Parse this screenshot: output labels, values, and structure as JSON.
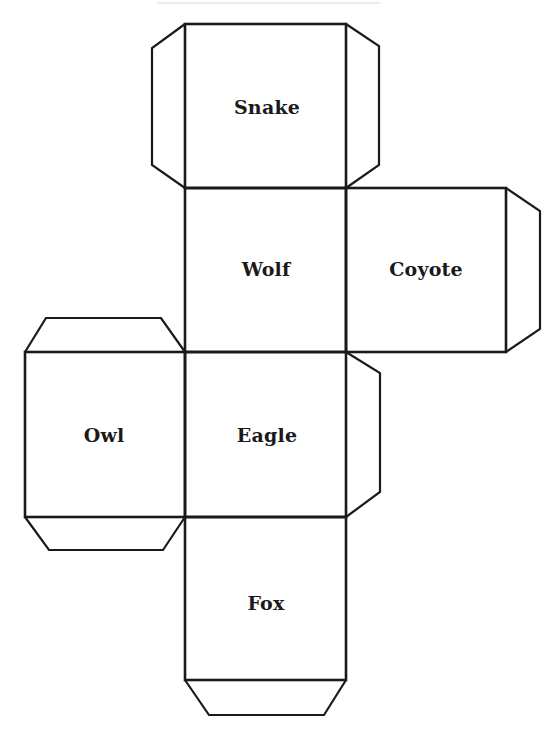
{
  "diagram": {
    "type": "cube-net",
    "stroke_color": "#1a1a1a",
    "background": "#ffffff",
    "faces": [
      {
        "id": "snake",
        "label": "Snake",
        "x": 185,
        "y": 24,
        "w": 161,
        "h": 164,
        "cx": 267,
        "cy": 107
      },
      {
        "id": "wolf",
        "label": "Wolf",
        "x": 185,
        "y": 188,
        "w": 161,
        "h": 164,
        "cx": 266,
        "cy": 269
      },
      {
        "id": "coyote",
        "label": "Coyote",
        "x": 346,
        "y": 188,
        "w": 160,
        "h": 164,
        "cx": 426,
        "cy": 269
      },
      {
        "id": "owl",
        "label": "Owl",
        "x": 25,
        "y": 352,
        "w": 160,
        "h": 165,
        "cx": 104,
        "cy": 435
      },
      {
        "id": "eagle",
        "label": "Eagle",
        "x": 185,
        "y": 352,
        "w": 161,
        "h": 165,
        "cx": 267,
        "cy": 435
      },
      {
        "id": "fox",
        "label": "Fox",
        "x": 185,
        "y": 517,
        "w": 161,
        "h": 163,
        "cx": 266,
        "cy": 603
      }
    ],
    "tabs": [
      {
        "id": "snake-left-tab",
        "points": "185,24 152,48 152,165 185,188"
      },
      {
        "id": "snake-right-tab",
        "points": "346,24 379,46 379,165 346,188"
      },
      {
        "id": "coyote-right-tab",
        "points": "506,188 540,211 540,329 506,352"
      },
      {
        "id": "owl-top-tab",
        "points": "25,352 46,318 161,318 185,352"
      },
      {
        "id": "owl-bottom-tab",
        "points": "25,517 49,550 163,550 185,517"
      },
      {
        "id": "eagle-right-tab",
        "points": "346,352 380,373 380,492 346,517"
      },
      {
        "id": "fox-bottom-tab",
        "points": "185,680 209,715 324,715 346,680"
      }
    ]
  }
}
